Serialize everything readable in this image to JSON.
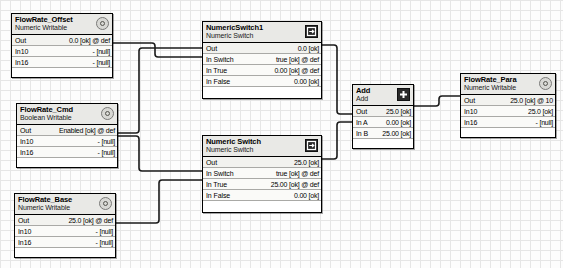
{
  "canvas": {
    "grid": true,
    "background_color": "#fdfdfd",
    "grid_color": "#e6e6e6",
    "wire_color": "#1a1a1a"
  },
  "nodes": {
    "flowrate_offset": {
      "title": "FlowRate_Offset",
      "subtitle": "Numeric Writable",
      "icon": "numeric-point-icon",
      "rows": [
        {
          "label": "Out",
          "value": "0.0 [ok] @ def"
        },
        {
          "label": "In10",
          "value": "- [null]"
        },
        {
          "label": "In16",
          "value": "- [null]"
        }
      ]
    },
    "flowrate_cmd": {
      "title": "FlowRate_Cmd",
      "subtitle": "Boolean Writable",
      "icon": "boolean-point-icon",
      "rows": [
        {
          "label": "Out",
          "value": "Enabled [ok] @ def"
        },
        {
          "label": "In10",
          "value": "- [null]"
        },
        {
          "label": "In16",
          "value": "- [null]"
        }
      ]
    },
    "flowrate_base": {
      "title": "FlowRate_Base",
      "subtitle": "Numeric Writable",
      "icon": "numeric-point-icon",
      "rows": [
        {
          "label": "Out",
          "value": "25.0 [ok] @ def"
        },
        {
          "label": "In10",
          "value": "- [null]"
        },
        {
          "label": "In16",
          "value": "- [null]"
        }
      ]
    },
    "numeric_switch_1": {
      "title": "NumericSwitch1",
      "subtitle": "Numeric Switch",
      "icon": "switch-icon",
      "rows": [
        {
          "label": "Out",
          "value": "0.0 [ok]"
        },
        {
          "label": "In Switch",
          "value": "true [ok] @ def"
        },
        {
          "label": "In True",
          "value": "0.00 [ok] @ def"
        },
        {
          "label": "In False",
          "value": "0.00 [ok]"
        }
      ]
    },
    "numeric_switch_2": {
      "title": "Numeric Switch",
      "subtitle": "Numeric Switch",
      "icon": "switch-icon",
      "rows": [
        {
          "label": "Out",
          "value": "25.0 [ok]"
        },
        {
          "label": "In Switch",
          "value": "true [ok] @ def"
        },
        {
          "label": "In True",
          "value": "25.00 [ok] @ def"
        },
        {
          "label": "In False",
          "value": "0.00 [ok]"
        }
      ]
    },
    "add": {
      "title": "Add",
      "subtitle": "Add",
      "icon": "add-icon",
      "rows": [
        {
          "label": "Out",
          "value": "25.0 [ok]"
        },
        {
          "label": "In A",
          "value": "0.00 [ok]"
        },
        {
          "label": "In B",
          "value": "25.00 [ok]"
        }
      ]
    },
    "flowrate_para": {
      "title": "FlowRate_Para",
      "subtitle": "Numeric Writable",
      "icon": "numeric-point-icon",
      "rows": [
        {
          "label": "Out",
          "value": "25.0 [ok] @ 10"
        },
        {
          "label": "In10",
          "value": "25.0 [ok]"
        },
        {
          "label": "In16",
          "value": "- [null]"
        }
      ]
    }
  }
}
